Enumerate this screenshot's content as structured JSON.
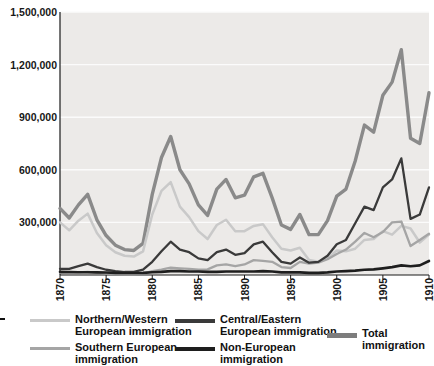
{
  "chart_data": {
    "type": "line",
    "title": "",
    "xlabel": "",
    "ylabel": "",
    "xlim": [
      1870,
      1910
    ],
    "ylim": [
      0,
      1500000
    ],
    "grid": true,
    "grid_axis": "y",
    "legend_position": "bottom",
    "plot_background": "#eceae8",
    "y_ticks": [
      0,
      300000,
      600000,
      900000,
      1200000,
      1500000
    ],
    "y_tick_labels": [
      "",
      "300,000",
      "600,000",
      "900,000",
      "1,200,000",
      "1,500,000"
    ],
    "x_ticks": [
      1870,
      1875,
      1880,
      1885,
      1890,
      1895,
      1900,
      1905,
      1910
    ],
    "x_tick_labels": [
      "1870",
      "1875",
      "1880",
      "1885",
      "1890",
      "1895",
      "1900",
      "1905",
      "1910"
    ],
    "x": [
      1870,
      1871,
      1872,
      1873,
      1874,
      1875,
      1876,
      1877,
      1878,
      1879,
      1880,
      1881,
      1882,
      1883,
      1884,
      1885,
      1886,
      1887,
      1888,
      1889,
      1890,
      1891,
      1892,
      1893,
      1894,
      1895,
      1896,
      1897,
      1898,
      1899,
      1900,
      1901,
      1902,
      1903,
      1904,
      1905,
      1906,
      1907,
      1908,
      1909,
      1910
    ],
    "series": [
      {
        "name": "Total immigration",
        "key": "total",
        "color": "#8a8a8a",
        "width": 3.4,
        "values": [
          380000,
          325000,
          400000,
          460000,
          315000,
          225000,
          170000,
          145000,
          140000,
          180000,
          460000,
          670000,
          790000,
          600000,
          520000,
          400000,
          340000,
          490000,
          545000,
          440000,
          455000,
          560000,
          580000,
          440000,
          285000,
          260000,
          345000,
          230000,
          230000,
          310000,
          450000,
          490000,
          650000,
          855000,
          815000,
          1025000,
          1100000,
          1285000,
          780000,
          750000,
          1040000
        ]
      },
      {
        "name": "Central/Eastern European immigration",
        "key": "central_eastern",
        "color": "#3a3a3a",
        "width": 2.3,
        "values": [
          35000,
          35000,
          50000,
          65000,
          45000,
          30000,
          22000,
          17000,
          18000,
          30000,
          75000,
          135000,
          190000,
          145000,
          130000,
          95000,
          85000,
          130000,
          145000,
          115000,
          125000,
          175000,
          190000,
          130000,
          75000,
          65000,
          100000,
          70000,
          75000,
          110000,
          175000,
          200000,
          295000,
          390000,
          370000,
          500000,
          545000,
          665000,
          320000,
          345000,
          500000
        ]
      },
      {
        "name": "Southern European immigration",
        "key": "southern",
        "color": "#a5a5a5",
        "width": 2.3,
        "values": [
          12000,
          12000,
          15000,
          18000,
          13000,
          9000,
          6000,
          5000,
          5000,
          8000,
          22000,
          30000,
          42000,
          38000,
          35000,
          30000,
          32000,
          55000,
          60000,
          50000,
          60000,
          85000,
          80000,
          75000,
          45000,
          40000,
          75000,
          65000,
          70000,
          90000,
          120000,
          145000,
          190000,
          240000,
          215000,
          245000,
          300000,
          305000,
          165000,
          200000,
          235000
        ]
      },
      {
        "name": "Northern/Western European immigration",
        "key": "northern_western",
        "color": "#c9c9c9",
        "width": 2.5,
        "values": [
          300000,
          255000,
          310000,
          350000,
          240000,
          170000,
          130000,
          110000,
          105000,
          135000,
          345000,
          480000,
          530000,
          390000,
          330000,
          250000,
          205000,
          285000,
          315000,
          250000,
          250000,
          280000,
          290000,
          215000,
          150000,
          140000,
          155000,
          85000,
          75000,
          95000,
          140000,
          135000,
          150000,
          200000,
          205000,
          250000,
          230000,
          280000,
          265000,
          185000,
          230000
        ]
      },
      {
        "name": "Non-European immigration",
        "key": "non_european",
        "color": "#1e1e1e",
        "width": 2.6,
        "values": [
          18000,
          17000,
          16000,
          16000,
          15000,
          14000,
          12000,
          11000,
          11000,
          12000,
          16000,
          18000,
          22000,
          22000,
          20000,
          20000,
          18000,
          18000,
          20000,
          20000,
          20000,
          20000,
          22000,
          20000,
          15000,
          15000,
          15000,
          12000,
          12000,
          15000,
          20000,
          22000,
          25000,
          30000,
          32000,
          38000,
          45000,
          55000,
          50000,
          55000,
          80000
        ]
      }
    ]
  },
  "legend": {
    "items": [
      {
        "label": "Northern/Western\nEuropean immigration",
        "color": "#c9c9c9",
        "thickness": 3
      },
      {
        "label": "Southern European\nimmigration",
        "color": "#a5a5a5",
        "thickness": 3
      },
      {
        "label": "Central/Eastern\nEuropean immigration",
        "color": "#3a3a3a",
        "thickness": 3.5
      },
      {
        "label": "Non-European\nimmigration",
        "color": "#1e1e1e",
        "thickness": 3.5
      },
      {
        "label": "Total immigration",
        "color": "#7d7d7d",
        "thickness": 5
      }
    ]
  }
}
